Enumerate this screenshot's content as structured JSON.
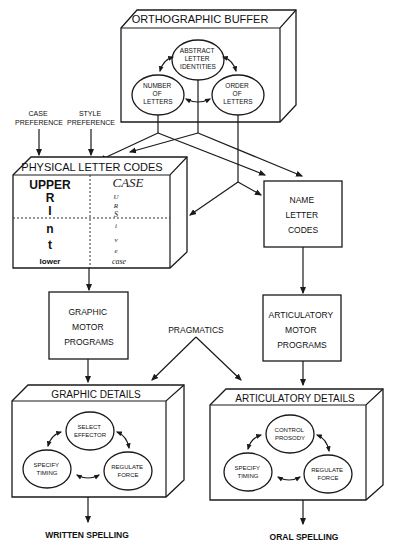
{
  "diagram": {
    "orthographic_buffer": {
      "title": "ORTHOGRAPHIC BUFFER",
      "nodes": {
        "abstract": [
          "ABSTRACT",
          "LETTER",
          "IDENTITIES"
        ],
        "number": [
          "NUMBER",
          "OF",
          "LETTERS"
        ],
        "order": [
          "ORDER",
          "OF",
          "LETTERS"
        ]
      }
    },
    "inputs": {
      "case_preference": [
        "CASE",
        "PREFERENCE"
      ],
      "style_preference": [
        "STYLE",
        "PREFERENCE"
      ]
    },
    "physical_letter_codes": {
      "title": "PHYSICAL LETTER CODES",
      "print_column": [
        "UPPER",
        "R",
        "I",
        "n",
        "t",
        "lower"
      ],
      "cursive_top": "CASE",
      "cursive_column": [
        "U",
        "R",
        "S",
        "i",
        "v",
        "e"
      ],
      "cursive_bottom": "case"
    },
    "name_letter_codes": [
      "NAME",
      "LETTER",
      "CODES"
    ],
    "graphic_motor_programs": [
      "GRAPHIC",
      "MOTOR",
      "PROGRAMS"
    ],
    "articulatory_motor_programs": [
      "ARTICULATORY",
      "MOTOR",
      "PROGRAMS"
    ],
    "pragmatics": "PRAGMATICS",
    "graphic_details": {
      "title": "GRAPHIC DETAILS",
      "nodes": {
        "top": [
          "SELECT",
          "EFFECTOR"
        ],
        "left": [
          "SPECIFY",
          "TIMING"
        ],
        "right": [
          "REGULATE",
          "FORCE"
        ]
      }
    },
    "articulatory_details": {
      "title": "ARTICULATORY DETAILS",
      "nodes": {
        "top": [
          "CONTROL",
          "PROSODY"
        ],
        "left": [
          "SPECIFY",
          "TIMING"
        ],
        "right": [
          "REGULATE",
          "FORCE"
        ]
      }
    },
    "outputs": {
      "written": "WRITTEN SPELLING",
      "oral": "ORAL SPELLING"
    }
  }
}
